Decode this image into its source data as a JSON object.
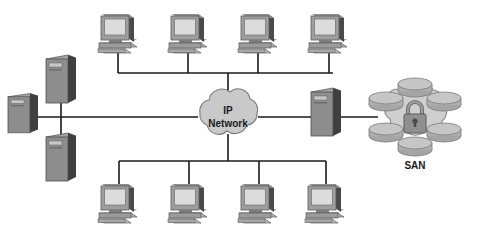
{
  "diagram": {
    "type": "network-topology",
    "title": "",
    "background_color": "#ffffff",
    "line_color": "#1a1a1a",
    "palette": {
      "device_light": "#d4d4d4",
      "device_mid": "#9a9a9a",
      "device_dark": "#5e5e5e",
      "device_shadow": "#3c3c3c",
      "screen": "#d8d8d8",
      "cloud_fill": "#c9c9c9",
      "cloud_stroke": "#8a8a8a",
      "san_fill": "#cfcfcf",
      "disk_fill": "#b5b5b5",
      "disk_top": "#c9c9c9",
      "lock_fill": "#8f8f8f"
    },
    "nodes": {
      "cloud": {
        "label_line1": "IP",
        "label_line2": "Network",
        "name": "ip-network-cloud",
        "cx": 228,
        "cy": 117
      },
      "san": {
        "label": "SAN",
        "name": "san-storage",
        "cx": 415,
        "cy": 117,
        "disk_count": 6,
        "has_padlock": true
      },
      "workstations_top": [
        {
          "name": "workstation-top-1",
          "x": 98,
          "y": 12
        },
        {
          "name": "workstation-top-2",
          "x": 168,
          "y": 12
        },
        {
          "name": "workstation-top-3",
          "x": 238,
          "y": 12
        },
        {
          "name": "workstation-top-4",
          "x": 308,
          "y": 12
        }
      ],
      "workstations_bottom": [
        {
          "name": "workstation-bottom-1",
          "x": 98,
          "y": 175
        },
        {
          "name": "workstation-bottom-2",
          "x": 168,
          "y": 175
        },
        {
          "name": "workstation-bottom-3",
          "x": 238,
          "y": 175
        },
        {
          "name": "workstation-bottom-4",
          "x": 302,
          "y": 175
        }
      ],
      "servers": [
        {
          "name": "server-left-edge",
          "x": 8,
          "y": 92,
          "w": 30,
          "h": 38
        },
        {
          "name": "server-left-upper",
          "x": 46,
          "y": 55,
          "w": 30,
          "h": 48
        },
        {
          "name": "server-left-lower",
          "x": 46,
          "y": 128,
          "w": 30,
          "h": 48
        },
        {
          "name": "server-right-gateway",
          "x": 311,
          "y": 88,
          "w": 24,
          "h": 58
        }
      ]
    },
    "links": {
      "top_bus_y": 73,
      "top_bus_x1": 118,
      "top_bus_x2": 333,
      "bottom_bus_y": 161,
      "bottom_bus_x1": 119,
      "bottom_bus_x2": 326,
      "trunk_y": 117,
      "trunk_x1": 38,
      "trunk_x2": 196,
      "right_link_x1": 262,
      "right_link_x2": 375,
      "left_vertical_x": 61
    }
  }
}
